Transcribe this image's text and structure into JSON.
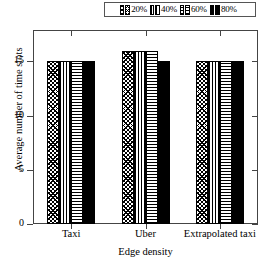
{
  "chart_data": {
    "type": "bar",
    "title": "",
    "xlabel": "Edge density",
    "ylabel": "Average number of time slots",
    "categories": [
      "Taxi",
      "Uber",
      "Extrapolated taxi"
    ],
    "series": [
      {
        "name": "20%",
        "pattern": "crosshatch",
        "values": [
          15,
          16,
          15
        ]
      },
      {
        "name": "40%",
        "pattern": "vertical-lines",
        "values": [
          15,
          16,
          15
        ]
      },
      {
        "name": "60%",
        "pattern": "horizontal-lines",
        "values": [
          15,
          16,
          15
        ]
      },
      {
        "name": "80%",
        "pattern": "solid-black",
        "values": [
          15,
          15,
          15
        ]
      }
    ],
    "yticks": [
      0,
      5,
      10,
      15
    ],
    "ylim": [
      0,
      17.8
    ],
    "grid": false,
    "legend_position": "top-center",
    "legend_entries": [
      "20%",
      "40%",
      "60%",
      "80%"
    ],
    "colors": {
      "foreground": "#000000",
      "background": "#ffffff",
      "frame": "#444444"
    }
  },
  "legend": {
    "entries": [
      {
        "label": "20%"
      },
      {
        "label": "40%"
      },
      {
        "label": "60%"
      },
      {
        "label": "80%"
      }
    ]
  },
  "axes": {
    "ylabel": "Average number of time slots",
    "xlabel": "Edge density",
    "yticks": [
      {
        "label": "15"
      },
      {
        "label": "10"
      },
      {
        "label": "5"
      },
      {
        "label": "0"
      }
    ],
    "xcats": [
      {
        "label": "Taxi"
      },
      {
        "label": "Uber"
      },
      {
        "label": "Extrapolated taxi"
      }
    ]
  }
}
